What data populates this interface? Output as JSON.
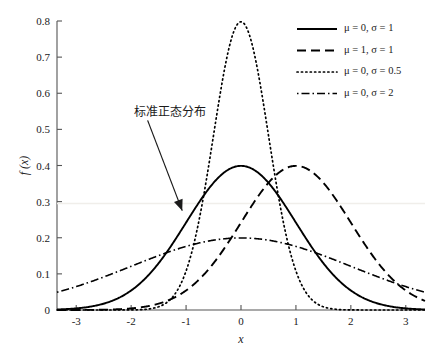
{
  "chart_data": {
    "type": "line",
    "title": "",
    "xlabel": "x",
    "ylabel": "f (x)",
    "xlim": [
      -3.35,
      3.35
    ],
    "ylim": [
      0,
      0.8
    ],
    "grid": false,
    "legend_position": "top-right",
    "xticks": [
      "-3",
      "-2",
      "-1",
      "0",
      "1",
      "2",
      "3"
    ],
    "xtick_values": [
      -3,
      -2,
      -1,
      0,
      1,
      2,
      3
    ],
    "yticks": [
      "0",
      "0.1",
      "0.2",
      "0.3",
      "0.4",
      "0.5",
      "0.6",
      "0.7",
      "0.8"
    ],
    "ytick_values": [
      0,
      0.1,
      0.2,
      0.3,
      0.4,
      0.5,
      0.6,
      0.7,
      0.8
    ],
    "annotations": [
      {
        "text": "标准正态分布",
        "text_x": -1.95,
        "text_y": 0.555,
        "arrow_from_x": -1.7,
        "arrow_from_y": 0.525,
        "arrow_to_x": -1.07,
        "arrow_to_y": 0.275
      }
    ],
    "series": [
      {
        "name": "mu-0-sigma-1",
        "legend_text": "μ = 0, σ = 1",
        "mu": 0,
        "sigma": 1,
        "style": "solid",
        "color": "#000000",
        "peak_value": 0.399,
        "x": [
          -3.35,
          -3,
          -2.5,
          -2,
          -1.5,
          -1,
          -0.5,
          0,
          0.5,
          1,
          1.5,
          2,
          2.5,
          3,
          3.35
        ],
        "values": [
          0.0015,
          0.0044,
          0.0175,
          0.054,
          0.1295,
          0.242,
          0.3521,
          0.3989,
          0.3521,
          0.242,
          0.1295,
          0.054,
          0.0175,
          0.0044,
          0.0015
        ]
      },
      {
        "name": "mu-1-sigma-1",
        "legend_text": "μ = 1, σ = 1",
        "mu": 1,
        "sigma": 1,
        "style": "dashed",
        "color": "#000000",
        "peak_value": 0.399,
        "x": [
          -3.35,
          -3,
          -2.5,
          -2,
          -1.5,
          -1,
          -0.5,
          0,
          0.5,
          1,
          1.5,
          2,
          2.5,
          3,
          3.35
        ],
        "values": [
          0.0,
          0.0001,
          0.0004,
          0.0044,
          0.0175,
          0.054,
          0.1295,
          0.242,
          0.3521,
          0.3989,
          0.3521,
          0.242,
          0.1295,
          0.054,
          0.0252
        ]
      },
      {
        "name": "mu-0-sigma-0p5",
        "legend_text": "μ = 0, σ = 0.5",
        "mu": 0,
        "sigma": 0.5,
        "style": "dotted",
        "color": "#000000",
        "peak_value": 0.798,
        "x": [
          -2,
          -1.5,
          -1,
          -0.75,
          -0.5,
          -0.25,
          0,
          0.25,
          0.5,
          0.75,
          1,
          1.5,
          2
        ],
        "values": [
          0.0003,
          0.0089,
          0.108,
          0.259,
          0.4839,
          0.7041,
          0.7979,
          0.7041,
          0.4839,
          0.259,
          0.108,
          0.0089,
          0.0003
        ]
      },
      {
        "name": "mu-0-sigma-2",
        "legend_text": "μ = 0, σ = 2",
        "mu": 0,
        "sigma": 2,
        "style": "dashdot",
        "color": "#000000",
        "peak_value": 0.199,
        "x": [
          -3.35,
          -3,
          -2.5,
          -2,
          -1.5,
          -1,
          -0.5,
          0,
          0.5,
          1,
          1.5,
          2,
          2.5,
          3,
          3.35
        ],
        "values": [
          0.0511,
          0.0648,
          0.0913,
          0.121,
          0.1506,
          0.176,
          0.1933,
          0.1995,
          0.1933,
          0.176,
          0.1506,
          0.121,
          0.0913,
          0.0648,
          0.0511
        ]
      }
    ]
  },
  "legend": {
    "entries": [
      {
        "label": "μ = 0, σ = 1"
      },
      {
        "label": "μ = 1, σ = 1"
      },
      {
        "label": "μ = 0, σ = 0.5"
      },
      {
        "label": "μ = 0, σ = 2"
      }
    ]
  }
}
